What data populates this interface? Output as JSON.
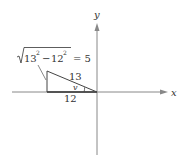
{
  "diagram": {
    "axes": {
      "x_label": "x",
      "y_label": "y"
    },
    "triangle": {
      "hypotenuse_label": "13",
      "adjacent_label": "12",
      "angle_label": "v",
      "opposite_formula": {
        "radicand_a": "13",
        "radicand_b": "12",
        "exponent": "2",
        "minus": "−",
        "equals": "= 5"
      }
    },
    "colors": {
      "axis": "#777777",
      "triangle": "#444444",
      "text": "#333333"
    }
  }
}
